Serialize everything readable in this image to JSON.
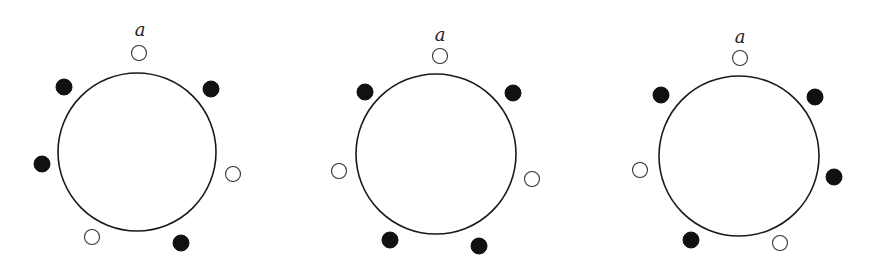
{
  "figure": {
    "width": 875,
    "height": 277,
    "colors": {
      "background": "#ffffff",
      "filled_bead": "#111111",
      "open_bead_stroke": "#333333",
      "ring_stroke": "#1a1a1a"
    },
    "bead_radius": 8,
    "necklaces": [
      {
        "id": "necklace-1",
        "label": "a",
        "label_pos": [
          140,
          30
        ],
        "ring": {
          "cx": 137,
          "cy": 152,
          "r": 79
        },
        "beads": [
          {
            "pos": "top",
            "x": 139,
            "y": 53,
            "type": "open"
          },
          {
            "pos": "upper-right",
            "x": 211,
            "y": 89,
            "type": "filled"
          },
          {
            "pos": "right",
            "x": 233,
            "y": 174,
            "type": "open"
          },
          {
            "pos": "lower-right",
            "x": 181,
            "y": 243,
            "type": "filled"
          },
          {
            "pos": "lower-left",
            "x": 92,
            "y": 237,
            "type": "open"
          },
          {
            "pos": "left",
            "x": 42,
            "y": 164,
            "type": "filled"
          },
          {
            "pos": "upper-left",
            "x": 64,
            "y": 87,
            "type": "filled"
          }
        ]
      },
      {
        "id": "necklace-2",
        "label": "a",
        "label_pos": [
          440,
          35
        ],
        "ring": {
          "cx": 436,
          "cy": 154,
          "r": 80
        },
        "beads": [
          {
            "pos": "top",
            "x": 440,
            "y": 56,
            "type": "open"
          },
          {
            "pos": "upper-right",
            "x": 513,
            "y": 93,
            "type": "filled"
          },
          {
            "pos": "right",
            "x": 532,
            "y": 179,
            "type": "open"
          },
          {
            "pos": "lower-right",
            "x": 479,
            "y": 246,
            "type": "filled"
          },
          {
            "pos": "lower-left",
            "x": 390,
            "y": 240,
            "type": "filled"
          },
          {
            "pos": "left",
            "x": 339,
            "y": 171,
            "type": "open"
          },
          {
            "pos": "upper-left",
            "x": 365,
            "y": 92,
            "type": "filled"
          }
        ]
      },
      {
        "id": "necklace-3",
        "label": "a",
        "label_pos": [
          740,
          37
        ],
        "ring": {
          "cx": 739,
          "cy": 156,
          "r": 80
        },
        "beads": [
          {
            "pos": "top",
            "x": 740,
            "y": 58,
            "type": "open"
          },
          {
            "pos": "upper-right",
            "x": 815,
            "y": 97,
            "type": "filled"
          },
          {
            "pos": "right",
            "x": 834,
            "y": 177,
            "type": "filled"
          },
          {
            "pos": "lower-right",
            "x": 780,
            "y": 243,
            "type": "open"
          },
          {
            "pos": "lower-left",
            "x": 691,
            "y": 240,
            "type": "filled"
          },
          {
            "pos": "left",
            "x": 640,
            "y": 170,
            "type": "open"
          },
          {
            "pos": "upper-left",
            "x": 661,
            "y": 95,
            "type": "filled"
          }
        ]
      }
    ]
  }
}
